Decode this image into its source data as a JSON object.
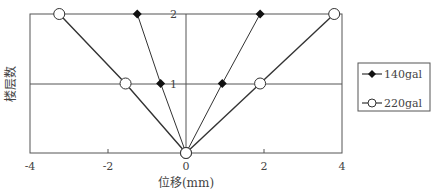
{
  "chart_data": {
    "type": "line",
    "title": "",
    "xlabel": "位移(mm)",
    "ylabel": "楼层数",
    "xlim": [
      -4,
      4
    ],
    "ylim": [
      0,
      2
    ],
    "x_ticks": [
      "-4",
      "-2",
      "0",
      "2",
      "4"
    ],
    "y_ticks": [
      "1",
      "2"
    ],
    "grid": "horizontal lines at floors 1 and 2; vertical line at x=0",
    "legend_position": "right",
    "series": [
      {
        "name": "140gal",
        "marker": "filled-diamond",
        "branches": [
          {
            "x": [
              0,
              -0.65,
              -1.25
            ],
            "y": [
              0,
              1,
              2
            ]
          },
          {
            "x": [
              0,
              0.93,
              1.9
            ],
            "y": [
              0,
              1,
              2
            ]
          }
        ]
      },
      {
        "name": "220gal",
        "marker": "open-circle",
        "branches": [
          {
            "x": [
              0,
              -1.55,
              -3.25
            ],
            "y": [
              0,
              1,
              2
            ]
          },
          {
            "x": [
              0,
              1.9,
              3.8
            ],
            "y": [
              0,
              1,
              2
            ]
          }
        ]
      }
    ]
  },
  "axes": {
    "xlabel": "位移(mm)",
    "ylabel": "楼层数",
    "x_ticks": [
      "-4",
      "-2",
      "0",
      "2",
      "4"
    ],
    "y_ticks": {
      "floor1": "1",
      "floor2": "2"
    }
  },
  "legend": {
    "items": [
      {
        "label": "140gal",
        "marker": "filled-diamond"
      },
      {
        "label": "220gal",
        "marker": "open-circle"
      }
    ]
  }
}
